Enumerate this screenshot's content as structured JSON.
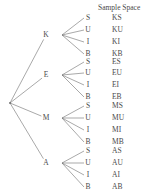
{
  "header": {
    "sample_space_title": "Sample Space"
  },
  "tree": {
    "root": {
      "label": "",
      "x": 10,
      "y": 103
    },
    "level1": [
      {
        "name": "node-k",
        "label": "K",
        "x": 46,
        "y": 35
      },
      {
        "name": "node-e",
        "label": "E",
        "x": 46,
        "y": 75
      },
      {
        "name": "node-m",
        "label": "M",
        "x": 46,
        "y": 118
      },
      {
        "name": "node-a",
        "label": "A",
        "x": 46,
        "y": 163
      }
    ],
    "leaf_labels": [
      "S",
      "U",
      "I",
      "B"
    ],
    "branches": [
      {
        "parent": "K",
        "fan_x": 62,
        "leaf_x": 88,
        "leaves": [
          {
            "label": "S",
            "y": 18,
            "outcome": "KS"
          },
          {
            "label": "U",
            "y": 30,
            "outcome": "KU"
          },
          {
            "label": "I",
            "y": 42,
            "outcome": "KI"
          },
          {
            "label": "B",
            "y": 54,
            "outcome": "KB"
          }
        ]
      },
      {
        "parent": "E",
        "fan_x": 62,
        "leaf_x": 88,
        "leaves": [
          {
            "label": "S",
            "y": 62,
            "outcome": "ES"
          },
          {
            "label": "U",
            "y": 73,
            "outcome": "EU"
          },
          {
            "label": "I",
            "y": 85,
            "outcome": "EI"
          },
          {
            "label": "B",
            "y": 97,
            "outcome": "EB"
          }
        ]
      },
      {
        "parent": "M",
        "fan_x": 62,
        "leaf_x": 88,
        "leaves": [
          {
            "label": "S",
            "y": 106,
            "outcome": "MS"
          },
          {
            "label": "U",
            "y": 118,
            "outcome": "MU"
          },
          {
            "label": "I",
            "y": 130,
            "outcome": "MI"
          },
          {
            "label": "B",
            "y": 142,
            "outcome": "MB"
          }
        ]
      },
      {
        "parent": "A",
        "fan_x": 62,
        "leaf_x": 88,
        "leaves": [
          {
            "label": "S",
            "y": 151,
            "outcome": "AS"
          },
          {
            "label": "U",
            "y": 163,
            "outcome": "AU"
          },
          {
            "label": "I",
            "y": 175,
            "outcome": "AI"
          },
          {
            "label": "B",
            "y": 187,
            "outcome": "AB"
          }
        ]
      }
    ]
  },
  "sample_space": {
    "column_x": 112,
    "outcomes": [
      {
        "text": "KS",
        "y": 18
      },
      {
        "text": "KU",
        "y": 30
      },
      {
        "text": "KI",
        "y": 42
      },
      {
        "text": "KB",
        "y": 54
      },
      {
        "text": "ES",
        "y": 62
      },
      {
        "text": "EU",
        "y": 73
      },
      {
        "text": "EI",
        "y": 85
      },
      {
        "text": "EB",
        "y": 97
      },
      {
        "text": "MS",
        "y": 106
      },
      {
        "text": "MU",
        "y": 118
      },
      {
        "text": "MI",
        "y": 130
      },
      {
        "text": "MB",
        "y": 142
      },
      {
        "text": "AS",
        "y": 151
      },
      {
        "text": "AU",
        "y": 163
      },
      {
        "text": "AI",
        "y": 175
      },
      {
        "text": "AB",
        "y": 187
      }
    ]
  },
  "style": {
    "line_color": "#6e6e6e",
    "text_color": "#4a4a4a",
    "background": "#ffffff"
  }
}
